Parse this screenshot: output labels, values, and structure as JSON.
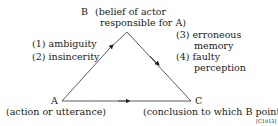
{
  "diagram": {
    "nodes": {
      "B": {
        "letter": "B",
        "desc_line1": "(belief of actor",
        "desc_line2": "responsible for A)"
      },
      "A": {
        "letter": "A",
        "desc": "(action or utterance)"
      },
      "C": {
        "letter": "C",
        "desc": "(conclusion to which B points)"
      }
    },
    "left_edge_labels": [
      "(1)  ambiguity",
      "(2)  insincerity"
    ],
    "right_edge_labels": {
      "item3_line1": "(3)  erroneous",
      "item3_line2": "memory",
      "item4_line1": "(4)  faulty",
      "item4_line2": "perception"
    },
    "figure_code": "[C1913]"
  }
}
